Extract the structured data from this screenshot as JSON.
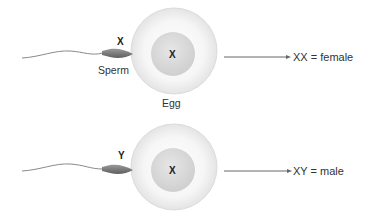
{
  "rows": [
    {
      "sperm_chromosome": "X",
      "sperm_label": "Sperm",
      "egg_chromosome": "X",
      "egg_label": "Egg",
      "result": "XX = female"
    },
    {
      "sperm_chromosome": "Y",
      "egg_chromosome": "X",
      "result": "XY = male"
    }
  ],
  "colors": {
    "egg_outer": "#f2f2f2",
    "egg_nucleus": "#d8d8d8",
    "sperm": "#777777",
    "arrow": "#666666",
    "text": "#333333"
  }
}
